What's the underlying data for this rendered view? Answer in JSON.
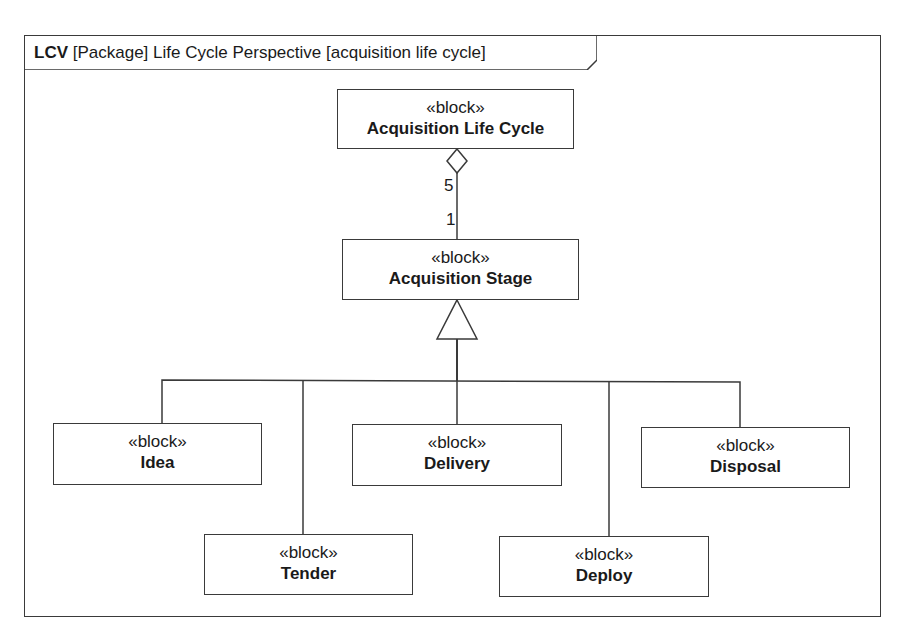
{
  "diagram": {
    "frame": {
      "kind": "LCV",
      "type": "[Package]",
      "name": "Life Cycle Perspective",
      "context": "[acquisition life cycle]"
    },
    "blocks": {
      "lifecycle": {
        "stereotype": "«block»",
        "name": "Acquisition Life Cycle"
      },
      "stage": {
        "stereotype": "«block»",
        "name": "Acquisition Stage"
      },
      "idea": {
        "stereotype": "«block»",
        "name": "Idea"
      },
      "tender": {
        "stereotype": "«block»",
        "name": "Tender"
      },
      "delivery": {
        "stereotype": "«block»",
        "name": "Delivery"
      },
      "deploy": {
        "stereotype": "«block»",
        "name": "Deploy"
      },
      "disposal": {
        "stereotype": "«block»",
        "name": "Disposal"
      }
    },
    "aggregation": {
      "whole_multiplicity": "5",
      "part_multiplicity": "1"
    }
  }
}
